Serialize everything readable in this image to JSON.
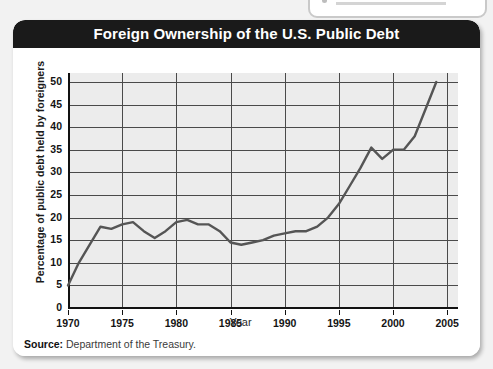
{
  "card": {
    "title": "Foreign Ownership of the U.S. Public Debt",
    "source_label": "Source:",
    "source_text": " Department of the Treasury."
  },
  "colors": {
    "title_bar": "#1a1a1a",
    "title_text": "#ffffff",
    "plot_background": "#ececec",
    "gridline": "#4a4a4a",
    "axis": "#111111",
    "line": "#555555"
  },
  "chart_data": {
    "type": "line",
    "title": "Foreign Ownership of the U.S. Public Debt",
    "xlabel": "Year",
    "ylabel": "Percentage of public debt held by foreigners",
    "xlim": [
      1970,
      2006
    ],
    "ylim": [
      0,
      52
    ],
    "grid": true,
    "legend": null,
    "x_ticks": [
      1970,
      1975,
      1980,
      1985,
      1990,
      1995,
      2000,
      2005
    ],
    "y_ticks": [
      0,
      5,
      10,
      15,
      20,
      25,
      30,
      35,
      40,
      45,
      50
    ],
    "series": [
      {
        "name": "Percentage of public debt held by foreigners",
        "x": [
          1970,
          1971,
          1972,
          1973,
          1974,
          1975,
          1976,
          1977,
          1978,
          1979,
          1980,
          1981,
          1982,
          1983,
          1984,
          1985,
          1986,
          1987,
          1988,
          1989,
          1990,
          1991,
          1992,
          1993,
          1994,
          1995,
          1996,
          1997,
          1998,
          1999,
          2000,
          2001,
          2002,
          2003,
          2004
        ],
        "values": [
          5,
          10,
          14,
          18,
          17.5,
          18.5,
          19,
          17,
          15.5,
          17,
          19,
          19.5,
          18.5,
          18.5,
          17,
          14.5,
          14,
          14.5,
          15,
          16,
          16.5,
          17,
          17,
          18,
          20,
          23,
          27,
          31,
          35.5,
          33,
          35,
          35,
          38,
          44,
          50
        ]
      }
    ]
  },
  "top_stub": {
    "present": true
  }
}
